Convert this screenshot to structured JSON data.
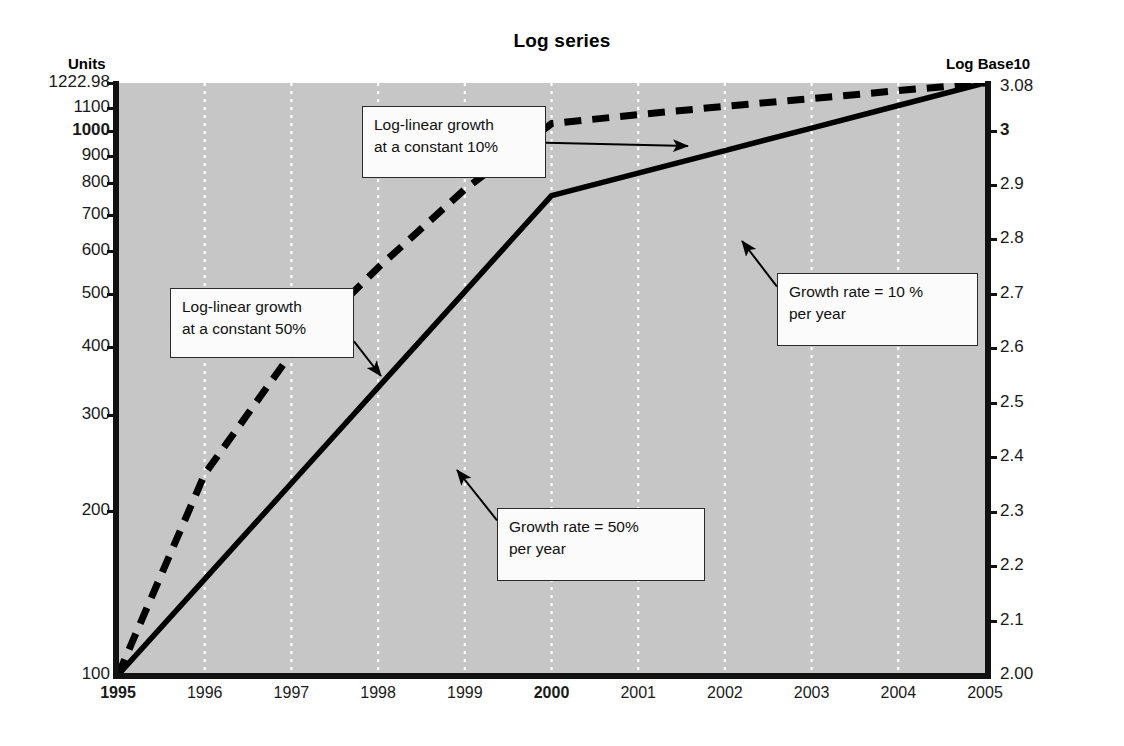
{
  "chart_data": {
    "type": "line",
    "title": "Log series",
    "xlabel": "",
    "ylabel": "Units",
    "y2label": "Log Base10",
    "grid": "vertical-dotted-white",
    "legend": "none",
    "background": "#c6c6c6",
    "x": [
      "1995",
      "1996",
      "1997",
      "1998",
      "1999",
      "2000",
      "2001",
      "2002",
      "2003",
      "2004",
      "2005"
    ],
    "xlim": [
      1995,
      2005
    ],
    "ylim": [
      100,
      1222.98
    ],
    "yscale": "log10",
    "y2lim": [
      2.0,
      3.08
    ],
    "yticks": [
      "1222.98",
      "1100",
      "1000",
      "900",
      "800",
      "700",
      "600",
      "500",
      "400",
      "300",
      "200",
      "100"
    ],
    "ytick_values": [
      1222.98,
      1100,
      1000,
      900,
      800,
      700,
      600,
      500,
      400,
      300,
      200,
      100
    ],
    "ytick_bold": [
      "1000"
    ],
    "y2ticks": [
      "3.08",
      "3",
      "2.9",
      "2.8",
      "2.7",
      "2.6",
      "2.5",
      "2.4",
      "2.3",
      "2.2",
      "2.1",
      "2.00"
    ],
    "y2tick_values": [
      3.08,
      3.0,
      2.9,
      2.8,
      2.7,
      2.6,
      2.5,
      2.4,
      2.3,
      2.2,
      2.1,
      2.0
    ],
    "y2tick_bold": [
      "3"
    ],
    "xtick_bold": [
      "1995",
      "2000"
    ],
    "series": [
      {
        "name": "Actual series",
        "style": "solid",
        "color": "#000000",
        "values": [
          100,
          150,
          225,
          337.5,
          506.25,
          759.38,
          835.31,
          918.85,
          1010.73,
          1111.81,
          1222.98
        ],
        "log10_values": [
          2.0,
          2.176,
          2.352,
          2.528,
          2.704,
          2.88,
          2.922,
          2.963,
          3.005,
          3.046,
          3.088
        ]
      },
      {
        "name": "Log-linear reference",
        "style": "dashed",
        "color": "#000000",
        "values": [
          100,
          234,
          390,
          560,
          780,
          1030,
          1070,
          1108,
          1145,
          1184,
          1222.98
        ],
        "log10_values": [
          2.0,
          2.369,
          2.591,
          2.748,
          2.892,
          3.013,
          3.029,
          3.045,
          3.059,
          3.073,
          3.088
        ]
      }
    ],
    "annotations": [
      {
        "id": "log-linear-10",
        "text": "Log-linear growth\nat a constant 10%",
        "box": {
          "x": 362,
          "y": 106,
          "w": 184,
          "h": 72
        },
        "arrow_to": {
          "x": 688,
          "y": 146
        }
      },
      {
        "id": "log-linear-50",
        "text": "Log-linear growth\nat a constant 50%",
        "box": {
          "x": 170,
          "y": 288,
          "w": 184,
          "h": 70
        },
        "arrow_to": {
          "x": 381,
          "y": 376
        }
      },
      {
        "id": "growth-rate-10",
        "text": "Growth rate = 10 %\nper year",
        "box": {
          "x": 777,
          "y": 273,
          "w": 201,
          "h": 73
        },
        "arrow_to": {
          "x": 742,
          "y": 241
        }
      },
      {
        "id": "growth-rate-50",
        "text": "Growth rate = 50%\nper year",
        "box": {
          "x": 497,
          "y": 508,
          "w": 208,
          "h": 73
        },
        "arrow_to": {
          "x": 457,
          "y": 470
        }
      }
    ]
  },
  "axes": {
    "left_caption": "Units",
    "right_caption": "Log Base10"
  }
}
